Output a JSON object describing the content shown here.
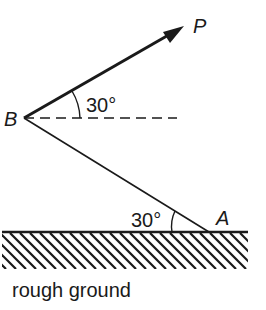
{
  "diagram": {
    "type": "mechanics-force-diagram",
    "points": {
      "B": {
        "label": "B"
      },
      "A": {
        "label": "A"
      },
      "P": {
        "label": "P"
      }
    },
    "angles": {
      "force_angle": {
        "label": "30°",
        "description": "angle between force P and horizontal at B"
      },
      "ground_angle": {
        "label": "30°",
        "description": "angle between rod AB and ground at A"
      }
    },
    "ground": {
      "label": "rough ground"
    },
    "colors": {
      "ink": "#1a1a1a",
      "background": "#ffffff"
    }
  }
}
